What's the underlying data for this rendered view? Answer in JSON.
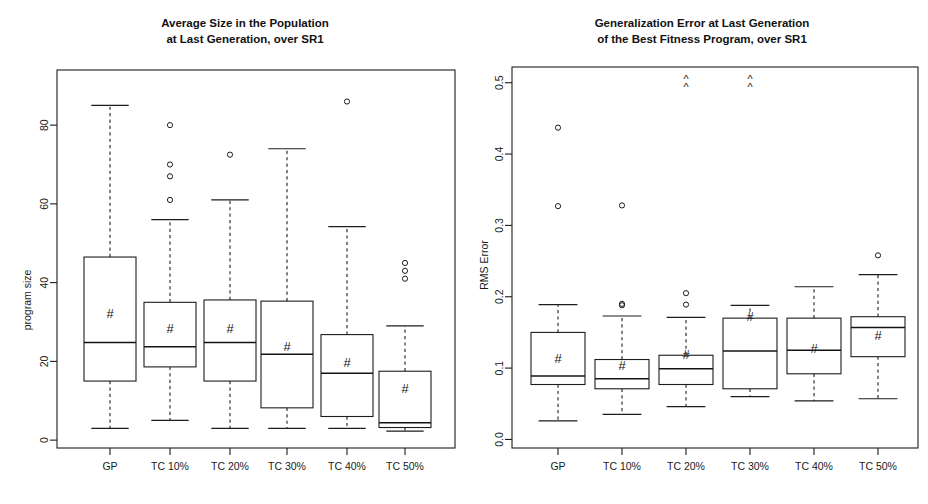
{
  "figure": {
    "width": 928,
    "height": 504,
    "background": "#ffffff",
    "ink_color": "#1d1d1d"
  },
  "chart_data": [
    {
      "type": "box",
      "panel": "left",
      "title": "Average Size in the Population\nat Last Generation, over SR1",
      "title_line1": "Average Size in the Population",
      "title_line2": "at Last Generation, over SR1",
      "xlabel": "",
      "ylabel": "program size",
      "ylim": [
        -2,
        94
      ],
      "yticks": [
        0,
        20,
        40,
        60,
        80
      ],
      "ytick_labels": [
        "0",
        "20",
        "40",
        "60",
        "80"
      ],
      "grid": false,
      "legend": "none",
      "mean_marker": "#",
      "categories": [
        "GP",
        "TC 10%",
        "TC 20%",
        "TC 30%",
        "TC 40%",
        "TC 50%"
      ],
      "boxes": [
        {
          "label": "GP",
          "whisker_low": 3.0,
          "q1": 15.0,
          "median": 24.8,
          "q3": 46.5,
          "whisker_high": 85.0,
          "mean": 32.3,
          "outliers": [],
          "above_range": false
        },
        {
          "label": "TC 10%",
          "whisker_low": 5.0,
          "q1": 18.6,
          "median": 23.7,
          "q3": 35.0,
          "whisker_high": 56.0,
          "mean": 28.6,
          "outliers": [
            61.0,
            67.0,
            70.0,
            80.0
          ],
          "above_range": false
        },
        {
          "label": "TC 20%",
          "whisker_low": 3.0,
          "q1": 15.0,
          "median": 24.8,
          "q3": 35.6,
          "whisker_high": 61.0,
          "mean": 28.6,
          "outliers": [
            72.5
          ],
          "above_range": false
        },
        {
          "label": "TC 30%",
          "whisker_low": 3.0,
          "q1": 8.2,
          "median": 21.8,
          "q3": 35.3,
          "whisker_high": 74.0,
          "mean": 23.8,
          "outliers": [],
          "above_range": false
        },
        {
          "label": "TC 40%",
          "whisker_low": 3.0,
          "q1": 6.0,
          "median": 17.0,
          "q3": 26.8,
          "whisker_high": 54.2,
          "mean": 19.9,
          "outliers": [
            86.0
          ],
          "above_range": false
        },
        {
          "label": "TC 50%",
          "whisker_low": 2.3,
          "q1": 3.2,
          "median": 4.4,
          "q3": 17.5,
          "whisker_high": 29.0,
          "mean": 13.2,
          "outliers": [
            41.0,
            43.0,
            45.0
          ],
          "above_range": false
        }
      ]
    },
    {
      "type": "box",
      "panel": "right",
      "title": "Generalization Error at Last Generation\nof the Best Fitness Program, over SR1",
      "title_line1": "Generalization Error at Last Generation",
      "title_line2": "of the Best Fitness Program, over SR1",
      "xlabel": "",
      "ylabel": "RMS Error",
      "ylim": [
        -0.012,
        0.522
      ],
      "yticks": [
        0.0,
        0.1,
        0.2,
        0.3,
        0.4,
        0.5
      ],
      "ytick_labels": [
        "0.0",
        "0.1",
        "0.2",
        "0.3",
        "0.4",
        "0.5"
      ],
      "grid": false,
      "legend": "none",
      "mean_marker": "#",
      "out_of_range_marker": "^",
      "categories": [
        "GP",
        "TC 10%",
        "TC 20%",
        "TC 30%",
        "TC 40%",
        "TC 50%"
      ],
      "boxes": [
        {
          "label": "GP",
          "whisker_low": 0.026,
          "q1": 0.077,
          "median": 0.089,
          "q3": 0.15,
          "whisker_high": 0.189,
          "mean": 0.114,
          "outliers": [
            0.327,
            0.437
          ],
          "above_range": false
        },
        {
          "label": "TC 10%",
          "whisker_low": 0.035,
          "q1": 0.071,
          "median": 0.085,
          "q3": 0.112,
          "whisker_high": 0.173,
          "mean": 0.104,
          "outliers": [
            0.188,
            0.19,
            0.328
          ],
          "above_range": false
        },
        {
          "label": "TC 20%",
          "whisker_low": 0.046,
          "q1": 0.077,
          "median": 0.099,
          "q3": 0.118,
          "whisker_high": 0.171,
          "mean": 0.12,
          "outliers": [
            0.189,
            0.205
          ],
          "above_range": true
        },
        {
          "label": "TC 30%",
          "whisker_low": 0.06,
          "q1": 0.071,
          "median": 0.124,
          "q3": 0.17,
          "whisker_high": 0.188,
          "mean": 0.173,
          "outliers": [],
          "above_range": true
        },
        {
          "label": "TC 40%",
          "whisker_low": 0.054,
          "q1": 0.092,
          "median": 0.125,
          "q3": 0.17,
          "whisker_high": 0.214,
          "mean": 0.128,
          "outliers": [],
          "above_range": false
        },
        {
          "label": "TC 50%",
          "whisker_low": 0.057,
          "q1": 0.116,
          "median": 0.157,
          "q3": 0.172,
          "whisker_high": 0.231,
          "mean": 0.147,
          "outliers": [
            0.258
          ],
          "above_range": false
        }
      ]
    }
  ]
}
